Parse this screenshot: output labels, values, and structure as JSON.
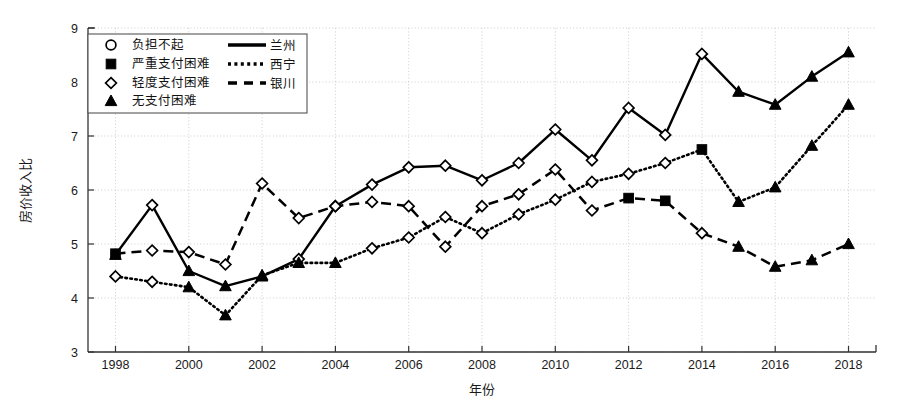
{
  "chart_data": {
    "type": "line",
    "title": "",
    "xlabel": "年份",
    "ylabel": "房价收入比",
    "xlim": [
      1997.25,
      2018.75
    ],
    "ylim": [
      3,
      9
    ],
    "xticks": [
      1998,
      2000,
      2002,
      2004,
      2006,
      2008,
      2010,
      2012,
      2014,
      2016,
      2018
    ],
    "yticks": [
      3,
      4,
      5,
      6,
      7,
      8,
      9
    ],
    "grid": true,
    "legend_position": "top-left",
    "x": [
      1998,
      1999,
      2000,
      2001,
      2002,
      2003,
      2004,
      2005,
      2006,
      2007,
      2008,
      2009,
      2010,
      2011,
      2012,
      2013,
      2014,
      2015,
      2016,
      2017,
      2018
    ],
    "series": [
      {
        "name": "兰州",
        "linestyle": "solid",
        "values": [
          4.8,
          5.72,
          4.5,
          4.22,
          4.4,
          4.72,
          5.7,
          6.1,
          6.42,
          6.45,
          6.18,
          6.5,
          7.12,
          6.55,
          7.52,
          7.02,
          8.52,
          7.82,
          7.58,
          8.1,
          8.55
        ],
        "markers": [
          "无支付困难",
          "轻度支付困难",
          "无支付困难",
          "无支付困难",
          "无支付困难",
          "轻度支付困难",
          "轻度支付困难",
          "轻度支付困难",
          "轻度支付困难",
          "轻度支付困难",
          "轻度支付困难",
          "轻度支付困难",
          "轻度支付困难",
          "轻度支付困难",
          "轻度支付困难",
          "轻度支付困难",
          "轻度支付困难",
          "无支付困难",
          "无支付困难",
          "无支付困难",
          "无支付困难"
        ]
      },
      {
        "name": "西宁",
        "linestyle": "dotted",
        "values": [
          4.4,
          4.3,
          4.2,
          3.68,
          4.42,
          4.65,
          4.65,
          4.92,
          5.12,
          5.5,
          5.2,
          5.55,
          5.82,
          6.15,
          6.3,
          6.5,
          6.75,
          5.78,
          6.05,
          6.82,
          7.58
        ],
        "markers": [
          "轻度支付困难",
          "轻度支付困难",
          "无支付困难",
          "无支付困难",
          "无支付困难",
          "无支付困难",
          "无支付困难",
          "轻度支付困难",
          "轻度支付困难",
          "轻度支付困难",
          "轻度支付困难",
          "轻度支付困难",
          "轻度支付困难",
          "轻度支付困难",
          "轻度支付困难",
          "轻度支付困难",
          "严重支付困难",
          "无支付困难",
          "无支付困难",
          "无支付困难",
          "无支付困难"
        ]
      },
      {
        "name": "银川",
        "linestyle": "dashed",
        "values": [
          4.82,
          4.88,
          4.85,
          4.62,
          6.12,
          5.48,
          5.7,
          5.78,
          5.7,
          4.95,
          5.7,
          5.92,
          6.38,
          5.62,
          5.85,
          5.8,
          5.2,
          4.95,
          4.58,
          4.7,
          5.0
        ],
        "markers": [
          "严重支付困难",
          "轻度支付困难",
          "轻度支付困难",
          "轻度支付困难",
          "轻度支付困难",
          "轻度支付困难",
          "轻度支付困难",
          "轻度支付困难",
          "轻度支付困难",
          "轻度支付困难",
          "轻度支付困难",
          "轻度支付困难",
          "轻度支付困难",
          "轻度支付困难",
          "严重支付困难",
          "严重支付困难",
          "轻度支付困难",
          "无支付困难",
          "无支付困难",
          "无支付困难",
          "无支付困难"
        ]
      }
    ]
  },
  "legend": {
    "markers": [
      {
        "symbol": "circle",
        "label": "负担不起"
      },
      {
        "symbol": "square",
        "label": "严重支付困难"
      },
      {
        "symbol": "diamond",
        "label": "轻度支付困难"
      },
      {
        "symbol": "triangle",
        "label": "无支付困难"
      }
    ],
    "lines": [
      {
        "style": "solid",
        "label": "兰州"
      },
      {
        "style": "dotted",
        "label": "西宁"
      },
      {
        "style": "dashed",
        "label": "银川"
      }
    ]
  },
  "axes": {
    "y_title": "房价收入比",
    "x_title": "年份",
    "y_tick_labels": [
      "3",
      "4",
      "5",
      "6",
      "7",
      "8",
      "9"
    ],
    "x_tick_labels": [
      "1998",
      "2000",
      "2002",
      "2004",
      "2006",
      "2008",
      "2010",
      "2012",
      "2014",
      "2016",
      "2018"
    ]
  },
  "colors": {
    "line": "#000000",
    "grid": "#cccccc",
    "axis": "#333333",
    "background": "#ffffff"
  }
}
